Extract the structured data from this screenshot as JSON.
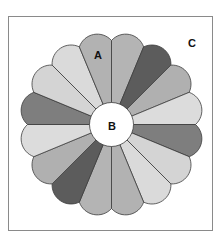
{
  "diagram": {
    "type": "quilt-block",
    "center": {
      "x": 111.5,
      "y": 124.5
    },
    "center_circle_radius": 22,
    "petal_edge_radius": 84,
    "petal_arc_radius": 19,
    "petal_count": 16,
    "petal_outline_color": "#3c3c3c",
    "center_circle_fill": "#ffffff",
    "petals": [
      {
        "index": 1,
        "start_deg": 0,
        "end_deg": 22.5,
        "fill": "#b4b4b4"
      },
      {
        "index": 2,
        "start_deg": 22.5,
        "end_deg": 45,
        "fill": "#5c5c5c"
      },
      {
        "index": 3,
        "start_deg": 45,
        "end_deg": 67.5,
        "fill": "#b0b0b0"
      },
      {
        "index": 4,
        "start_deg": 67.5,
        "end_deg": 90,
        "fill": "#dcdcdc"
      },
      {
        "index": 5,
        "start_deg": 90,
        "end_deg": 112.5,
        "fill": "#7e7e7e"
      },
      {
        "index": 6,
        "start_deg": 112.5,
        "end_deg": 135,
        "fill": "#d4d4d4"
      },
      {
        "index": 7,
        "start_deg": 135,
        "end_deg": 157.5,
        "fill": "#dadada"
      },
      {
        "index": 8,
        "start_deg": 157.5,
        "end_deg": 180,
        "fill": "#b2b2b2"
      },
      {
        "index": 9,
        "start_deg": 180,
        "end_deg": 202.5,
        "fill": "#b4b4b4"
      },
      {
        "index": 10,
        "start_deg": 202.5,
        "end_deg": 225,
        "fill": "#5c5c5c"
      },
      {
        "index": 11,
        "start_deg": 225,
        "end_deg": 247.5,
        "fill": "#b0b0b0"
      },
      {
        "index": 12,
        "start_deg": 247.5,
        "end_deg": 270,
        "fill": "#dcdcdc"
      },
      {
        "index": 13,
        "start_deg": 270,
        "end_deg": 292.5,
        "fill": "#7e7e7e"
      },
      {
        "index": 14,
        "start_deg": 292.5,
        "end_deg": 315,
        "fill": "#d4d4d4"
      },
      {
        "index": 15,
        "start_deg": 315,
        "end_deg": 337.5,
        "fill": "#dadada"
      },
      {
        "index": 16,
        "start_deg": 337.5,
        "end_deg": 360,
        "fill": "#b2b2b2"
      }
    ],
    "labels": {
      "a": {
        "text": "A",
        "x": 98,
        "y": 55,
        "refers_to": "petal (blade)"
      },
      "b": {
        "text": "B",
        "x": 112,
        "y": 126,
        "refers_to": "center circle"
      },
      "c": {
        "text": "C",
        "x": 192,
        "y": 43,
        "refers_to": "background square"
      }
    },
    "frame": {
      "border_color": "#8a8a8a",
      "background": "#ffffff"
    }
  }
}
